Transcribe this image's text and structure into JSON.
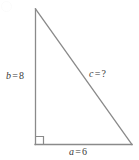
{
  "figure": {
    "name": "right-triangle-pythagorean-diagram",
    "background_color": "#ffffff",
    "stroke_color": "#8a8a8a",
    "text_color": "#3a3a3a",
    "stroke_width": 1.2
  },
  "labels": {
    "vertical_leg": {
      "variable": "b",
      "operator": "=",
      "value": "8",
      "full": "b = 8"
    },
    "hypotenuse": {
      "variable": "c",
      "operator": "=",
      "value": "?",
      "full": "c = ?"
    },
    "horizontal_leg": {
      "variable": "a",
      "operator": "=",
      "value": "6",
      "full": "a = 6"
    }
  },
  "geometry": {
    "apex": {
      "x": 35,
      "y": 9
    },
    "right_angle_vertex": {
      "x": 35,
      "y": 144
    },
    "base_right_vertex": {
      "x": 132,
      "y": 144
    },
    "right_angle_marker_size": 8
  }
}
